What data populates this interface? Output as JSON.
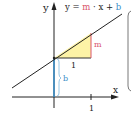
{
  "diagram": {
    "equation": {
      "prefix": "y = ",
      "m": "m",
      "dot": " · x + ",
      "b": "b"
    },
    "axes": {
      "x_label": "x",
      "y_label": "y",
      "x_tick_label": "1"
    },
    "slope_triangle": {
      "run_label": "1",
      "rise_label": "m"
    },
    "intercept": {
      "label": "b"
    },
    "colors": {
      "m": "#d9546c",
      "b": "#3a8fc8",
      "triangle_fill": "#fdf3a6",
      "line": "#222222"
    }
  }
}
